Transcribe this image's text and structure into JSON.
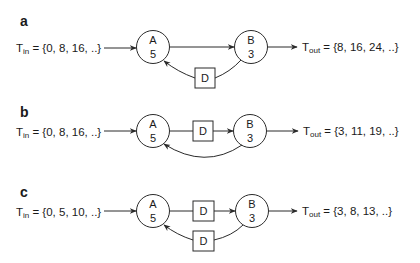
{
  "panels": [
    {
      "label": "a",
      "input": {
        "symbol": "T",
        "sub": "in",
        "eq": " = {0, 8, 16, ..}"
      },
      "node_a": {
        "name": "A",
        "value": "5"
      },
      "node_b": {
        "name": "B",
        "value": "3"
      },
      "forward_delays": [],
      "feedback_delays": [
        "D"
      ],
      "output": {
        "symbol": "T",
        "sub": "out",
        "eq": " = {8, 16, 24, ..}"
      }
    },
    {
      "label": "b",
      "input": {
        "symbol": "T",
        "sub": "in",
        "eq": " = {0, 8, 16, ..}"
      },
      "node_a": {
        "name": "A",
        "value": "5"
      },
      "node_b": {
        "name": "B",
        "value": "3"
      },
      "forward_delays": [
        "D"
      ],
      "feedback_delays": [],
      "output": {
        "symbol": "T",
        "sub": "out",
        "eq": " = {3, 11, 19, ..}"
      }
    },
    {
      "label": "c",
      "input": {
        "symbol": "T",
        "sub": "in",
        "eq": " = {0, 5, 10, ..}"
      },
      "node_a": {
        "name": "A",
        "value": "5"
      },
      "node_b": {
        "name": "B",
        "value": "3"
      },
      "forward_delays": [
        "D"
      ],
      "feedback_delays": [
        "D"
      ],
      "output": {
        "symbol": "T",
        "sub": "out",
        "eq": " = {3, 8, 13, ..}"
      }
    }
  ],
  "colors": {
    "ink": "#2a2a2a",
    "background": "#ffffff"
  }
}
